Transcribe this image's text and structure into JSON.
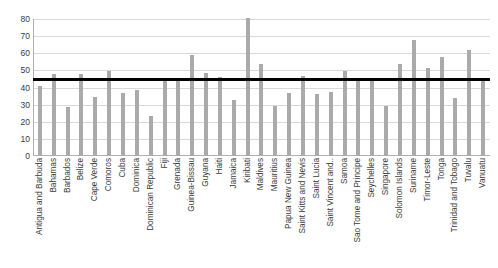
{
  "chart_data": {
    "type": "bar",
    "title": "",
    "xlabel": "",
    "ylabel": "",
    "ylim": [
      0,
      80
    ],
    "yticks": [
      0,
      10,
      20,
      30,
      40,
      50,
      60,
      70,
      80
    ],
    "grid": true,
    "legend": "none",
    "bar_color": "#aaaaaa",
    "reference_line": {
      "label": "average",
      "value": 45,
      "color": "#000000"
    },
    "categories": [
      "Antigua and Barbuda",
      "Bahamas",
      "Barbados",
      "Belize",
      "Cape Verde",
      "Comoros",
      "Cuba",
      "Dominica",
      "Dominican Republic",
      "Fiji",
      "Grenada",
      "Guinea-Bissau",
      "Guyana",
      "Haiti",
      "Jamaica",
      "Kiribati",
      "Maldives",
      "Mauritius",
      "Papua New Guinea",
      "Saint Kitts and Nevis",
      "Saint Lucia",
      "Saint Vincent and..",
      "Samoa",
      "Sao Tome and Principe",
      "Seychelles",
      "Singapore",
      "Solomon Islands",
      "Suriname",
      "Timor-Leste",
      "Tonga",
      "Trinidad and Tobago",
      "Tuvalu",
      "Vanuatu"
    ],
    "values": [
      41,
      48,
      28.5,
      48,
      34.5,
      49.5,
      37,
      38.5,
      23.5,
      45,
      45,
      59,
      48.5,
      46,
      32.5,
      80.5,
      54,
      29,
      37,
      47,
      36,
      37.5,
      49.5,
      44,
      44,
      29,
      53.5,
      68,
      51.5,
      58,
      34,
      62,
      44
    ]
  }
}
